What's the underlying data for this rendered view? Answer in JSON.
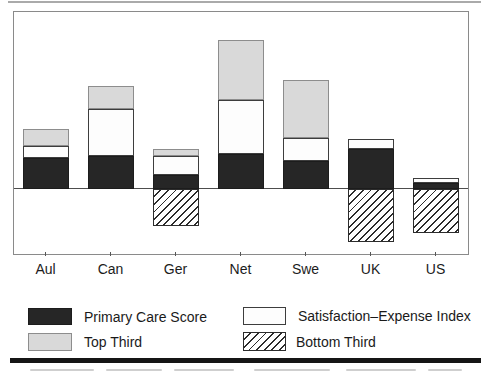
{
  "chart_data": {
    "type": "bar",
    "stacked": true,
    "title": "",
    "xlabel": "",
    "ylabel": "",
    "axis_note": "No numeric y-axis shown in figure; values estimated in source-pixel units relative to the zero line. Negative values are drawn below the zero line.",
    "zero_line": true,
    "grid": false,
    "legend_position": "below",
    "categories": [
      "Aul",
      "Can",
      "Ger",
      "Net",
      "Swe",
      "UK",
      "US"
    ],
    "series": [
      {
        "name": "Primary Care Score",
        "style": "solid-black",
        "values": [
          31,
          32.5,
          13.5,
          34.5,
          27.5,
          39.5,
          6
        ]
      },
      {
        "name": "Satisfaction–Expense Index",
        "style": "white",
        "values": [
          12,
          47.5,
          19,
          54,
          23.5,
          10.5,
          5
        ]
      },
      {
        "name": "Top Third",
        "style": "light-gray",
        "values": [
          16.5,
          22.5,
          7,
          60.5,
          57.5,
          0,
          0
        ]
      },
      {
        "name": "Bottom Third",
        "style": "hatched",
        "values": [
          0,
          0,
          -37.5,
          0,
          0,
          -53,
          -44.5
        ]
      }
    ]
  },
  "legend": {
    "col1_row1": "Primary Care Score",
    "col2_row1": "Satisfaction–Expense Index",
    "col1_row2": "Top Third",
    "col2_row2": "Bottom Third"
  },
  "colors": {
    "bar_black": "#262626",
    "bar_gray": "#d9d9d9",
    "frame_border": "#8a8a8a",
    "zero_line": "#4d4d4d",
    "bottom_rule": "#151515"
  }
}
